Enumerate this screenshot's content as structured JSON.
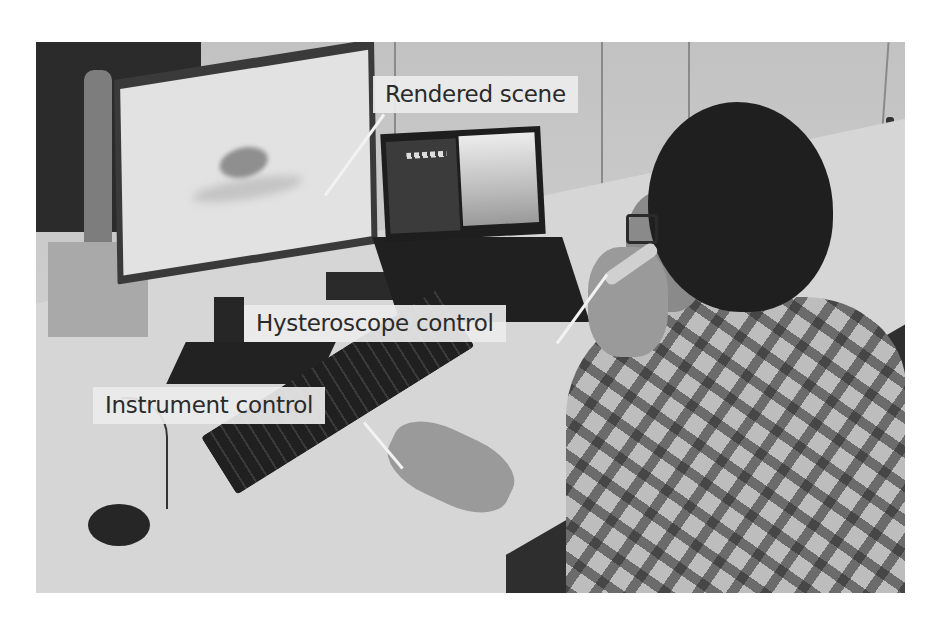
{
  "figure": {
    "callouts": [
      {
        "id": "rendered-scene",
        "label": "Rendered scene"
      },
      {
        "id": "hysteroscope-control",
        "label": "Hysteroscope control"
      },
      {
        "id": "instrument-control",
        "label": "Instrument control"
      }
    ]
  },
  "colors": {
    "label_background": "#ebebeb",
    "label_text": "#2a2a2a",
    "leader_line": "#f2f2f2"
  }
}
